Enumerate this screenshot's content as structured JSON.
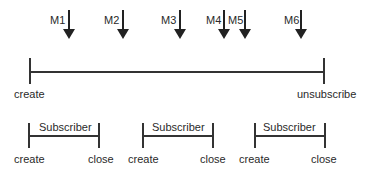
{
  "messages": [
    {
      "label": "M1",
      "x": 69
    },
    {
      "label": "M2",
      "x": 123
    },
    {
      "label": "M3",
      "x": 180
    },
    {
      "label": "M4",
      "x": 224
    },
    {
      "label": "M5",
      "x": 245
    },
    {
      "label": "M6",
      "x": 301
    }
  ],
  "main_timeline": {
    "start_label": "create",
    "end_label": "unsubscribe"
  },
  "subscribers": [
    {
      "label": "Subscriber",
      "start_label": "create",
      "end_label": "close"
    },
    {
      "label": "Subscriber",
      "start_label": "create",
      "end_label": "close"
    },
    {
      "label": "Subscriber",
      "start_label": "create",
      "end_label": "close"
    }
  ]
}
